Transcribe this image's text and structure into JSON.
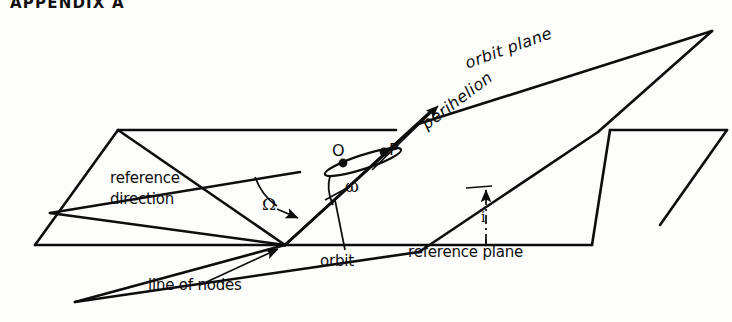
{
  "header": {
    "page_number": "",
    "title": "APPENDIX A"
  },
  "figure": {
    "name": "orbital-elements-diagram",
    "labels": {
      "orbit_plane": "orbit plane",
      "perihelion": "perihelion",
      "reference_line1": "reference",
      "reference_line2": "direction",
      "ascending_node_angle": "Ω",
      "argument_of_perihelion_angle": "ω",
      "point_O": "O",
      "point_P": "P",
      "orbit": "orbit",
      "inclination": "i",
      "reference_plane": "reference plane",
      "line_of_nodes": "line of nodes"
    },
    "colors": {
      "ink": "#0d0d0d",
      "paper": "#fdfdfc"
    }
  }
}
